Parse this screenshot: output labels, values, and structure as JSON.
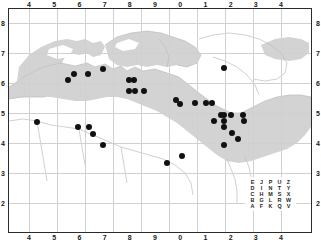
{
  "figure": {
    "type": "distribution-map",
    "width": 321,
    "height": 242,
    "background_color": "#ffffff",
    "frame_color": "#2b2b2b",
    "land_color": "#d3d3d3",
    "coastline_color": "#bcbcc4",
    "grid_color": "#cfcfd6",
    "point_color": "#111111"
  },
  "axes": {
    "top_labels": [
      "4",
      "5",
      "6",
      "7",
      "8",
      "9",
      "0",
      "1",
      "2",
      "3",
      "4"
    ],
    "bottom_labels": [
      "4",
      "5",
      "6",
      "7",
      "8",
      "9",
      "0",
      "1",
      "2",
      "3",
      "4"
    ],
    "left_labels": [
      "8",
      "7",
      "6",
      "5",
      "4",
      "3",
      "2"
    ],
    "right_labels": [
      "8",
      "7",
      "6",
      "5",
      "4",
      "3",
      "2"
    ]
  },
  "legend": {
    "name": "utm-square-letter-grid",
    "rows": [
      [
        "E",
        "J",
        "P",
        "U",
        "Z"
      ],
      [
        "D",
        "I",
        "N",
        "T",
        "Y"
      ],
      [
        "C",
        "H",
        "M",
        "S",
        "X"
      ],
      [
        "B",
        "G",
        "L",
        "R",
        "W"
      ],
      [
        "A",
        "F",
        "K",
        "Q",
        "V"
      ]
    ]
  },
  "chart_data": {
    "type": "scatter",
    "title": "",
    "xlabel": "",
    "ylabel": "",
    "xlim": [
      4,
      14
    ],
    "ylim": [
      2,
      8
    ],
    "grid": true,
    "legend_position": "bottom-right",
    "x_tick_labels": [
      "4",
      "5",
      "6",
      "7",
      "8",
      "9",
      "0",
      "1",
      "2",
      "3",
      "4"
    ],
    "y_tick_labels": [
      "8",
      "7",
      "6",
      "5",
      "4",
      "3",
      "2"
    ],
    "series": [
      {
        "name": "occurrence-records",
        "marker": "filled-circle",
        "color": "#111111",
        "count": 41,
        "points": [
          {
            "x": 4.3,
            "y": 4.7
          },
          {
            "x": 5.55,
            "y": 6.1
          },
          {
            "x": 5.8,
            "y": 6.3
          },
          {
            "x": 5.95,
            "y": 4.52
          },
          {
            "x": 6.35,
            "y": 6.3
          },
          {
            "x": 6.38,
            "y": 4.52
          },
          {
            "x": 6.55,
            "y": 4.3
          },
          {
            "x": 6.92,
            "y": 6.48
          },
          {
            "x": 6.92,
            "y": 3.92
          },
          {
            "x": 7.98,
            "y": 6.1
          },
          {
            "x": 7.98,
            "y": 5.72
          },
          {
            "x": 8.18,
            "y": 6.1
          },
          {
            "x": 8.22,
            "y": 5.72
          },
          {
            "x": 8.55,
            "y": 5.72
          },
          {
            "x": 9.48,
            "y": 3.32
          },
          {
            "x": 9.82,
            "y": 5.42
          },
          {
            "x": 9.98,
            "y": 5.3
          },
          {
            "x": 10.08,
            "y": 3.58
          },
          {
            "x": 10.58,
            "y": 5.32
          },
          {
            "x": 11.02,
            "y": 5.32
          },
          {
            "x": 11.25,
            "y": 5.32
          },
          {
            "x": 11.35,
            "y": 4.75
          },
          {
            "x": 11.6,
            "y": 4.92
          },
          {
            "x": 11.72,
            "y": 6.5
          },
          {
            "x": 11.72,
            "y": 4.92
          },
          {
            "x": 11.72,
            "y": 4.72
          },
          {
            "x": 11.72,
            "y": 4.52
          },
          {
            "x": 11.72,
            "y": 3.92
          },
          {
            "x": 12.02,
            "y": 4.92
          },
          {
            "x": 12.05,
            "y": 4.35
          },
          {
            "x": 12.28,
            "y": 4.12
          },
          {
            "x": 12.48,
            "y": 4.92
          },
          {
            "x": 12.52,
            "y": 4.75
          }
        ]
      }
    ]
  }
}
